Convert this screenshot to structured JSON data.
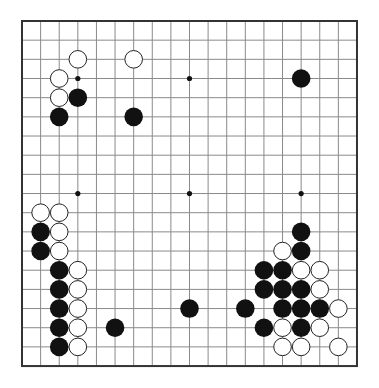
{
  "board": {
    "size": 19,
    "origin": {
      "x": 22,
      "y": 21
    },
    "spacing": {
      "x": 18.61,
      "y": 19.17
    },
    "line_color": "#8a8a8a",
    "border_color": "#333333",
    "background": "#ffffff",
    "stone_radius": 9.3,
    "hoshi": [
      [
        3,
        3
      ],
      [
        9,
        3
      ],
      [
        15,
        3
      ],
      [
        3,
        9
      ],
      [
        9,
        9
      ],
      [
        15,
        9
      ],
      [
        3,
        15
      ],
      [
        9,
        15
      ],
      [
        15,
        15
      ]
    ],
    "black_stones": [
      [
        3,
        4
      ],
      [
        2,
        5
      ],
      [
        6,
        5
      ],
      [
        15,
        3
      ],
      [
        1,
        11
      ],
      [
        1,
        12
      ],
      [
        2,
        13
      ],
      [
        2,
        14
      ],
      [
        2,
        15
      ],
      [
        2,
        16
      ],
      [
        2,
        17
      ],
      [
        5,
        16
      ],
      [
        9,
        15
      ],
      [
        15,
        11
      ],
      [
        15,
        12
      ],
      [
        13,
        13
      ],
      [
        14,
        13
      ],
      [
        13,
        14
      ],
      [
        14,
        14
      ],
      [
        15,
        14
      ],
      [
        12,
        15
      ],
      [
        14,
        15
      ],
      [
        15,
        15
      ],
      [
        16,
        15
      ],
      [
        13,
        16
      ],
      [
        15,
        16
      ]
    ],
    "white_stones": [
      [
        3,
        2
      ],
      [
        6,
        2
      ],
      [
        2,
        3
      ],
      [
        2,
        4
      ],
      [
        1,
        10
      ],
      [
        2,
        10
      ],
      [
        2,
        11
      ],
      [
        2,
        12
      ],
      [
        3,
        13
      ],
      [
        3,
        14
      ],
      [
        3,
        15
      ],
      [
        3,
        16
      ],
      [
        3,
        17
      ],
      [
        14,
        12
      ],
      [
        15,
        13
      ],
      [
        16,
        13
      ],
      [
        16,
        14
      ],
      [
        17,
        15
      ],
      [
        14,
        16
      ],
      [
        16,
        16
      ],
      [
        14,
        17
      ],
      [
        15,
        17
      ],
      [
        17,
        17
      ]
    ],
    "colors": {
      "black": "#111111",
      "white": "#ffffff",
      "white_outline": "#222222"
    }
  }
}
